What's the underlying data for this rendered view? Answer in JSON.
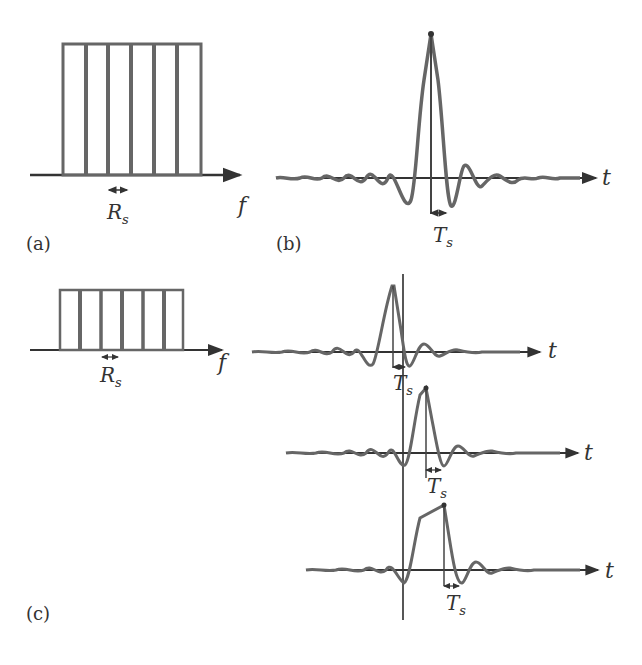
{
  "figure": {
    "stroke_color": "#555555",
    "panel_a": {
      "label": "(a)",
      "axis_label": "f",
      "spacing_label": "R",
      "spacing_subscript": "s",
      "subcarriers": 6
    },
    "panel_b": {
      "label": "(b)",
      "axis_label": "t",
      "spacing_label": "T",
      "spacing_subscript": "s"
    },
    "panel_c": {
      "label": "(c)",
      "spectrum": {
        "axis_label": "f",
        "spacing_label": "R",
        "spacing_subscript": "s",
        "subcarriers": 6
      },
      "pulses": [
        {
          "axis_label": "t",
          "spacing_label": "T",
          "spacing_subscript": "s"
        },
        {
          "axis_label": "t",
          "spacing_label": "T",
          "spacing_subscript": "s"
        },
        {
          "axis_label": "t",
          "spacing_label": "T",
          "spacing_subscript": "s"
        }
      ]
    }
  }
}
